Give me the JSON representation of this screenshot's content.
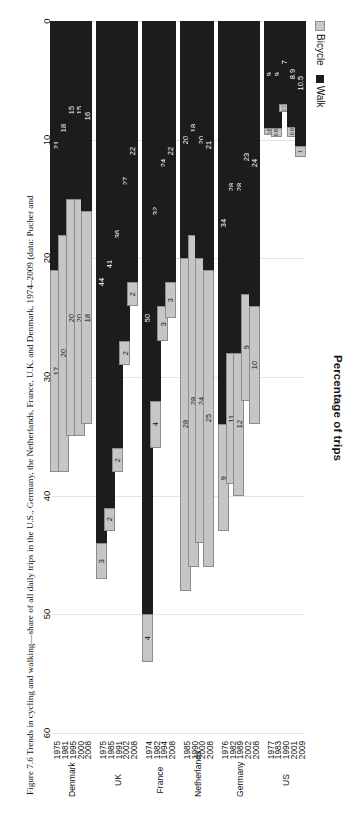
{
  "figure": {
    "title": "Percentage of trips",
    "caption": "Figure 7.6 Trends in cycling and walking—share of all daily trips in the U.S., Germany, the Netherlands, France, U.K. and Denmark, 1974–2009 (data: Pucher and"
  },
  "legend": {
    "entries": [
      {
        "label": "Bicycle",
        "color": "#c6c6c6"
      },
      {
        "label": "Walk",
        "color": "#1c1c1c"
      }
    ]
  },
  "colors": {
    "walk": "#1c1c1c",
    "bicycle": "#c6c6c6",
    "bicycle_border": "#8c8c8c",
    "gridline": "#e4e4e4",
    "text": "#111111"
  },
  "axis": {
    "x_label": "Percentage of trips",
    "ticks": [
      "0",
      "10",
      "20",
      "30",
      "40",
      "50",
      "60"
    ],
    "min": 0,
    "max": 60
  },
  "chart_data": {
    "type": "bar",
    "orientation": "horizontal",
    "stacked": true,
    "title": "Percentage of trips",
    "xlabel": "Percentage of trips",
    "ylabel": "",
    "xlim": [
      0,
      60
    ],
    "grid": true,
    "legend_position": "top-left",
    "series": [
      {
        "name": "Walk",
        "color": "#1c1c1c"
      },
      {
        "name": "Bicycle",
        "color": "#c6c6c6"
      }
    ],
    "groups": [
      {
        "country": "Denmark",
        "rows": [
          {
            "year": "1975",
            "walk": 21,
            "bicycle": 17,
            "total": 38
          },
          {
            "year": "1981",
            "walk": 18,
            "bicycle": 20,
            "total": 38
          },
          {
            "year": "1995",
            "walk": 15,
            "bicycle": 20,
            "total": 35
          },
          {
            "year": "2000",
            "walk": 15,
            "bicycle": 20,
            "total": 35
          },
          {
            "year": "2008",
            "walk": 16,
            "bicycle": 18,
            "total": 34
          }
        ]
      },
      {
        "country": "UK",
        "rows": [
          {
            "year": "1975",
            "walk": 44,
            "bicycle": 3,
            "total": 47
          },
          {
            "year": "1985",
            "walk": 41,
            "bicycle": 2,
            "total": 43
          },
          {
            "year": "1991",
            "walk": 36,
            "bicycle": 2,
            "total": 38
          },
          {
            "year": "2002",
            "walk": 27,
            "bicycle": 2,
            "total": 29
          },
          {
            "year": "2008",
            "walk": 22,
            "bicycle": 2,
            "total": 24
          }
        ]
      },
      {
        "country": "France",
        "rows": [
          {
            "year": "1974",
            "walk": 50,
            "bicycle": 4,
            "total": 54
          },
          {
            "year": "1982",
            "walk": 32,
            "bicycle": 4,
            "total": 36
          },
          {
            "year": "1994",
            "walk": 24,
            "bicycle": 3,
            "total": 27
          },
          {
            "year": "2008",
            "walk": 22,
            "bicycle": 3,
            "total": 25
          }
        ]
      },
      {
        "country": "Netherlands",
        "rows": [
          {
            "year": "1985",
            "walk": 20,
            "bicycle": 28,
            "total": 48
          },
          {
            "year": "1990",
            "walk": 18,
            "bicycle": 28,
            "total": 46
          },
          {
            "year": "2000",
            "walk": 20,
            "bicycle": 24,
            "total": 44
          },
          {
            "year": "2008",
            "walk": 21,
            "bicycle": 25,
            "total": 46
          }
        ]
      },
      {
        "country": "Germany",
        "rows": [
          {
            "year": "1976",
            "walk": 34,
            "bicycle": 9,
            "total": 43
          },
          {
            "year": "1982",
            "walk": 28,
            "bicycle": 11,
            "total": 39
          },
          {
            "year": "1989",
            "walk": 28,
            "bicycle": 12,
            "total": 40
          },
          {
            "year": "2002",
            "walk": 23,
            "bicycle": 9,
            "total": 32
          },
          {
            "year": "2008",
            "walk": 24,
            "bicycle": 10,
            "total": 34
          }
        ]
      },
      {
        "country": "US",
        "rows": [
          {
            "year": "1977",
            "walk": 9,
            "bicycle": 0.6,
            "total": 9.6
          },
          {
            "year": "1983",
            "walk": 9,
            "bicycle": 0.8,
            "total": 9.8
          },
          {
            "year": "1990",
            "walk": 7,
            "bicycle": 0.7,
            "total": 7.7
          },
          {
            "year": "2001",
            "walk": 8.9,
            "bicycle": 0.9,
            "total": 9.8
          },
          {
            "year": "2009",
            "walk": 10.5,
            "bicycle": 1.0,
            "total": 11.5
          }
        ]
      }
    ]
  }
}
